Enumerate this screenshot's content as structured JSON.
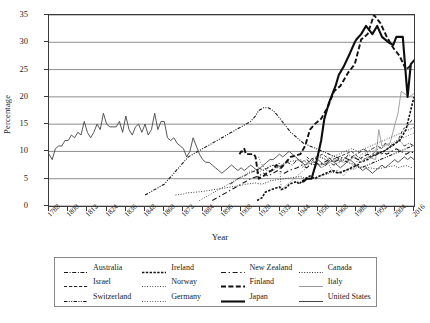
{
  "chart_data": {
    "type": "line",
    "title": "",
    "xlabel": "Year",
    "ylabel": "Percentage",
    "xlim": [
      1788,
      2016
    ],
    "ylim": [
      0,
      35
    ],
    "grid": "horizontal",
    "legend_position": "bottom",
    "ytick_labels": [
      "0",
      "5",
      "10",
      "15",
      "20",
      "25",
      "30",
      "35"
    ],
    "ytick_values": [
      0,
      5,
      10,
      15,
      20,
      25,
      30,
      35
    ],
    "xtick_labels": [
      "1788",
      "1800",
      "1812",
      "1824",
      "1836",
      "1848",
      "1860",
      "1872",
      "1884",
      "1896",
      "1908",
      "1920",
      "1932",
      "1944",
      "1956",
      "1968",
      "1980",
      "1992",
      "2004",
      "2016"
    ],
    "xtick_values": [
      1788,
      1800,
      1812,
      1824,
      1836,
      1848,
      1860,
      1872,
      1884,
      1896,
      1908,
      1920,
      1932,
      1944,
      1956,
      1968,
      1980,
      1992,
      2004,
      2016
    ],
    "series": [
      {
        "name": "Australia",
        "style": "dashdot",
        "width": 0.9,
        "color": "#1a1a1a",
        "x": [
          1901,
          1904,
          1906,
          1910,
          1913,
          1917,
          1919,
          1922,
          1925,
          1928,
          1931,
          1934,
          1937,
          1940,
          1943,
          1946,
          1949,
          1951,
          1954,
          1955,
          1958,
          1961,
          1963,
          1966,
          1969,
          1972,
          1974,
          1975,
          1977,
          1980,
          1983,
          1984,
          1987,
          1990,
          1993,
          1996,
          1998,
          2001,
          2004,
          2007,
          2010,
          2013,
          2016
        ],
        "values": [
          4.0,
          4.5,
          5.0,
          5.5,
          6.0,
          6.5,
          7.0,
          6.5,
          7.0,
          7.5,
          7.0,
          7.5,
          8.0,
          7.5,
          8.5,
          8.0,
          8.5,
          8.0,
          7.5,
          8.0,
          7.0,
          7.5,
          8.0,
          7.5,
          8.0,
          8.5,
          9.0,
          9.5,
          9.0,
          9.5,
          10.0,
          10.5,
          10.0,
          10.5,
          11.0,
          10.5,
          11.5,
          11.0,
          11.5,
          12.0,
          11.0,
          11.5,
          11.0
        ]
      },
      {
        "name": "Canada",
        "style": "dotted",
        "width": 0.9,
        "color": "#2a2a2a",
        "x": [
          1867,
          1872,
          1874,
          1878,
          1882,
          1887,
          1891,
          1896,
          1900,
          1904,
          1908,
          1911,
          1917,
          1921,
          1925,
          1926,
          1930,
          1935,
          1940,
          1945,
          1949,
          1953,
          1957,
          1958,
          1962,
          1963,
          1965,
          1968,
          1972,
          1974,
          1979,
          1980,
          1984,
          1988,
          1993,
          1997,
          2000,
          2004,
          2006,
          2008,
          2011,
          2015
        ],
        "values": [
          2.0,
          2.2,
          2.4,
          2.5,
          2.6,
          2.8,
          3.0,
          3.2,
          3.4,
          3.6,
          3.8,
          4.0,
          4.2,
          4.0,
          4.4,
          4.6,
          4.8,
          5.0,
          5.2,
          5.4,
          5.0,
          5.2,
          5.4,
          5.6,
          5.8,
          6.0,
          6.2,
          6.0,
          6.4,
          6.6,
          6.8,
          7.0,
          7.2,
          7.0,
          6.8,
          7.0,
          7.2,
          7.4,
          7.0,
          7.2,
          7.4,
          7.0
        ]
      },
      {
        "name": "Finland",
        "style": "dashed",
        "width": 1.9,
        "color": "#111111",
        "x": [
          1907,
          1908,
          1909,
          1910,
          1911,
          1913,
          1916,
          1917,
          1919,
          1922,
          1924,
          1927,
          1929,
          1930,
          1933,
          1936,
          1939,
          1945,
          1948,
          1951,
          1954,
          1958,
          1962,
          1966,
          1970,
          1972,
          1975,
          1979,
          1983,
          1987,
          1991,
          1995,
          1999,
          2003,
          2007,
          2011,
          2015
        ],
        "values": [
          9.5,
          10.0,
          10.0,
          10.5,
          9.5,
          9.5,
          9.5,
          9.0,
          5.0,
          5.5,
          6.0,
          6.5,
          7.0,
          7.5,
          7.0,
          8.0,
          9.0,
          9.5,
          11.0,
          14.0,
          15.0,
          16.0,
          18.0,
          21.0,
          22.0,
          23.0,
          24.5,
          26.0,
          30.5,
          31.5,
          35.0,
          33.5,
          31.0,
          29.0,
          27.5,
          25.0,
          26.0
        ]
      },
      {
        "name": "Germany",
        "style": "finedotted",
        "width": 0.9,
        "color": "#3a3a3a",
        "x": [
          1919,
          1920,
          1924,
          1928,
          1930,
          1932,
          1933,
          1949,
          1953,
          1957,
          1961,
          1965,
          1969,
          1972,
          1976,
          1980,
          1983,
          1987,
          1990,
          1994,
          1998,
          2002,
          2005,
          2009,
          2013,
          2017
        ],
        "values": [
          9.0,
          8.0,
          6.5,
          6.5,
          7.0,
          8.0,
          3.0,
          7.0,
          8.5,
          9.0,
          8.5,
          6.5,
          6.5,
          5.5,
          7.0,
          8.0,
          9.5,
          9.8,
          10.0,
          10.5,
          11.0,
          11.5,
          12.0,
          12.5,
          13.0,
          13.5
        ]
      },
      {
        "name": "Ireland",
        "style": "thickdotted",
        "width": 1.6,
        "color": "#111111",
        "x": [
          1918,
          1921,
          1922,
          1923,
          1927,
          1932,
          1933,
          1937,
          1938,
          1943,
          1944,
          1948,
          1951,
          1954,
          1957,
          1961,
          1965,
          1969,
          1973,
          1977,
          1981,
          1982,
          1987,
          1989,
          1992,
          1997,
          2002,
          2007,
          2011,
          2016
        ],
        "values": [
          1.0,
          1.5,
          2.0,
          2.5,
          3.0,
          3.5,
          3.0,
          3.5,
          4.0,
          4.5,
          4.0,
          5.0,
          5.5,
          5.0,
          5.5,
          6.0,
          6.5,
          6.0,
          6.5,
          7.0,
          7.5,
          8.0,
          8.5,
          9.0,
          9.5,
          10.0,
          11.0,
          12.0,
          14.0,
          20.0
        ]
      },
      {
        "name": "Israel",
        "style": "dashed",
        "width": 0.9,
        "color": "#222222",
        "x": [
          1949,
          1951,
          1955,
          1959,
          1961,
          1965,
          1969,
          1973,
          1977,
          1981,
          1984,
          1988,
          1992,
          1996,
          1999,
          2003,
          2006,
          2009,
          2013,
          2015
        ],
        "values": [
          9.0,
          8.5,
          9.0,
          9.5,
          9.0,
          8.5,
          9.0,
          9.5,
          10.0,
          9.0,
          8.5,
          9.0,
          10.0,
          9.5,
          10.5,
          11.0,
          12.0,
          14.0,
          15.0,
          16.0
        ]
      },
      {
        "name": "Italy",
        "style": "solid",
        "width": 0.9,
        "color": "#9a9a9a",
        "x": [
          1946,
          1948,
          1953,
          1958,
          1963,
          1968,
          1972,
          1976,
          1979,
          1983,
          1987,
          1992,
          1994,
          1996,
          2001,
          2006,
          2008,
          2013,
          2018
        ],
        "values": [
          7.0,
          7.5,
          8.0,
          7.5,
          8.0,
          8.5,
          8.0,
          8.5,
          9.0,
          8.0,
          9.0,
          8.5,
          14.0,
          11.0,
          11.5,
          17.0,
          21.0,
          20.0,
          21.0
        ]
      },
      {
        "name": "Japan",
        "style": "solid",
        "width": 2.1,
        "color": "#0d0d0d",
        "x": [
          1946,
          1947,
          1949,
          1952,
          1953,
          1955,
          1958,
          1960,
          1963,
          1967,
          1969,
          1972,
          1976,
          1979,
          1980,
          1983,
          1986,
          1990,
          1993,
          1996,
          2000,
          2003,
          2005,
          2009,
          2012,
          2014,
          2017
        ],
        "values": [
          4.5,
          4.5,
          5.0,
          5.0,
          6.0,
          8.0,
          12.0,
          16.0,
          19.0,
          22.0,
          24.0,
          25.5,
          28.0,
          30.0,
          30.5,
          31.5,
          33.0,
          31.5,
          33.0,
          31.0,
          30.0,
          29.5,
          31.0,
          31.0,
          20.0,
          26.0,
          27.0
        ]
      },
      {
        "name": "New Zealand",
        "style": "longdash",
        "width": 1.1,
        "color": "#1a1a1a",
        "x": [
          1890,
          1893,
          1896,
          1899,
          1902,
          1905,
          1908,
          1911,
          1914,
          1919,
          1922,
          1925,
          1928,
          1931,
          1935,
          1938,
          1943,
          1946,
          1949,
          1951,
          1954,
          1957,
          1960,
          1963,
          1966,
          1969,
          1972,
          1975,
          1978,
          1981,
          1984,
          1987,
          1990,
          1993,
          1996,
          1999,
          2002,
          2005,
          2008,
          2011,
          2014,
          2017
        ],
        "values": [
          1.0,
          1.5,
          2.0,
          2.5,
          3.0,
          3.5,
          4.0,
          4.5,
          5.0,
          5.5,
          6.0,
          5.5,
          6.0,
          6.5,
          6.0,
          6.5,
          7.0,
          7.5,
          7.0,
          7.5,
          8.0,
          7.5,
          8.0,
          8.5,
          8.0,
          8.5,
          9.0,
          8.5,
          9.0,
          8.5,
          9.0,
          9.5,
          9.0,
          9.5,
          10.0,
          9.5,
          10.0,
          10.5,
          10.0,
          9.5,
          10.0,
          9.5
        ]
      },
      {
        "name": "Norway",
        "style": "finedotted",
        "width": 1.0,
        "color": "#2a2a2a",
        "x": [
          1882,
          1885,
          1888,
          1891,
          1894,
          1897,
          1900,
          1903,
          1906,
          1909,
          1912,
          1915,
          1918,
          1921,
          1924,
          1927,
          1930,
          1933,
          1936,
          1945,
          1949,
          1953,
          1957,
          1961,
          1965,
          1969,
          1973,
          1977,
          1981,
          1985,
          1989,
          1993,
          1997,
          2001,
          2005,
          2009,
          2013,
          2017
        ],
        "values": [
          1.0,
          1.5,
          2.0,
          2.5,
          3.0,
          3.5,
          4.0,
          4.5,
          5.0,
          5.5,
          6.0,
          6.5,
          6.0,
          6.5,
          7.0,
          7.5,
          7.0,
          7.5,
          8.0,
          8.5,
          8.0,
          8.5,
          9.0,
          8.5,
          9.0,
          9.5,
          10.0,
          10.5,
          10.0,
          10.5,
          11.0,
          11.5,
          12.0,
          12.5,
          13.0,
          13.5,
          14.0,
          14.5
        ]
      },
      {
        "name": "Switzerland",
        "style": "dashdotdot",
        "width": 1.1,
        "color": "#1a1a1a",
        "x": [
          1848,
          1851,
          1854,
          1857,
          1860,
          1863,
          1866,
          1869,
          1872,
          1875,
          1878,
          1881,
          1884,
          1887,
          1890,
          1893,
          1896,
          1899,
          1902,
          1905,
          1908,
          1911,
          1914,
          1917,
          1919,
          1922,
          1925,
          1928,
          1931,
          1935,
          1939,
          1943,
          1947,
          1951,
          1955,
          1959,
          1963,
          1967,
          1971,
          1975,
          1979,
          1983,
          1987,
          1991,
          1995,
          1999,
          2003,
          2007,
          2011,
          2015
        ],
        "values": [
          2.0,
          2.5,
          3.0,
          3.5,
          4.0,
          5.0,
          6.0,
          7.0,
          8.0,
          9.0,
          9.5,
          10.0,
          10.5,
          11.0,
          11.5,
          12.0,
          12.5,
          13.0,
          13.5,
          14.0,
          14.5,
          15.0,
          15.5,
          16.5,
          17.5,
          18.0,
          18.0,
          17.5,
          16.5,
          15.0,
          13.5,
          12.5,
          11.5,
          11.0,
          10.5,
          10.0,
          9.5,
          9.0,
          8.5,
          8.0,
          7.5,
          7.0,
          7.5,
          8.0,
          8.5,
          9.0,
          9.5,
          10.0,
          10.5,
          11.0
        ]
      },
      {
        "name": "United States",
        "style": "solid",
        "width": 0.9,
        "color": "#444444",
        "x": [
          1788,
          1790,
          1792,
          1794,
          1796,
          1798,
          1800,
          1802,
          1804,
          1806,
          1808,
          1810,
          1812,
          1814,
          1816,
          1818,
          1820,
          1822,
          1824,
          1826,
          1828,
          1830,
          1832,
          1834,
          1836,
          1838,
          1840,
          1842,
          1844,
          1846,
          1848,
          1850,
          1852,
          1854,
          1856,
          1858,
          1860,
          1862,
          1864,
          1866,
          1868,
          1870,
          1872,
          1874,
          1876,
          1878,
          1880,
          1882,
          1884,
          1886,
          1888,
          1890,
          1892,
          1894,
          1896,
          1898,
          1900,
          1902,
          1904,
          1906,
          1908,
          1910,
          1912,
          1914,
          1916,
          1918,
          1920,
          1922,
          1924,
          1926,
          1928,
          1930,
          1932,
          1934,
          1936,
          1938,
          1940,
          1942,
          1944,
          1946,
          1948,
          1950,
          1952,
          1954,
          1956,
          1958,
          1960,
          1962,
          1964,
          1966,
          1968,
          1970,
          1972,
          1974,
          1976,
          1978,
          1980,
          1982,
          1984,
          1986,
          1988,
          1990,
          1992,
          1994,
          1996,
          1998,
          2000,
          2002,
          2004,
          2006,
          2008,
          2010,
          2012,
          2014,
          2016
        ],
        "values": [
          9.5,
          8.5,
          10.5,
          11.0,
          11.0,
          12.0,
          12.0,
          13.0,
          12.5,
          13.5,
          13.0,
          15.5,
          13.5,
          12.5,
          13.5,
          15.0,
          14.0,
          17.0,
          15.0,
          14.5,
          14.5,
          14.5,
          15.5,
          13.5,
          16.5,
          14.0,
          13.0,
          14.5,
          15.0,
          13.5,
          15.0,
          13.0,
          14.0,
          17.0,
          14.0,
          15.5,
          15.5,
          12.5,
          12.0,
          12.5,
          11.5,
          11.0,
          10.5,
          9.0,
          10.0,
          12.5,
          11.0,
          9.5,
          8.5,
          8.0,
          8.0,
          7.5,
          7.0,
          6.5,
          6.0,
          6.5,
          7.0,
          7.5,
          7.0,
          6.5,
          7.0,
          6.5,
          7.0,
          7.5,
          7.0,
          6.5,
          7.0,
          7.5,
          8.0,
          8.5,
          8.5,
          9.0,
          9.5,
          9.0,
          9.5,
          10.0,
          9.5,
          9.0,
          8.5,
          8.0,
          7.5,
          8.0,
          8.5,
          8.0,
          8.5,
          8.0,
          7.5,
          8.0,
          8.5,
          8.0,
          7.5,
          7.0,
          7.5,
          8.0,
          8.5,
          8.0,
          7.5,
          7.0,
          6.5,
          7.0,
          6.5,
          6.0,
          6.5,
          7.0,
          7.5,
          7.0,
          7.5,
          8.0,
          8.5,
          8.0,
          8.5,
          9.0,
          8.5,
          9.0,
          8.5
        ]
      }
    ]
  },
  "legend": {
    "entries": [
      {
        "label": "Australia"
      },
      {
        "label": "Canada"
      },
      {
        "label": "Finland"
      },
      {
        "label": "Germany"
      },
      {
        "label": "Ireland"
      },
      {
        "label": "Israel"
      },
      {
        "label": "Italy"
      },
      {
        "label": "Japan"
      },
      {
        "label": "New Zealand"
      },
      {
        "label": "Norway"
      },
      {
        "label": "Switzerland"
      },
      {
        "label": "United States"
      }
    ]
  }
}
